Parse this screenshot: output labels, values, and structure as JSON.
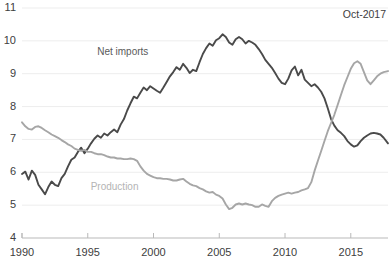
{
  "chart_data": {
    "type": "line",
    "title": "",
    "subtitle": "",
    "annotation": "Oct-2017",
    "xlabel": "",
    "ylabel": "",
    "xlim": [
      1990,
      2017.83
    ],
    "ylim": [
      4,
      11
    ],
    "xticks": [
      1990,
      1995,
      2000,
      2005,
      2010,
      2015
    ],
    "xticklabels": [
      "1990",
      "1995",
      "2000",
      "2005",
      "2010",
      "2015"
    ],
    "yticks": [
      4,
      5,
      6,
      7,
      8,
      9,
      10,
      11
    ],
    "yticklabels": [
      "4",
      "5",
      "6",
      "7",
      "8",
      "9",
      "10",
      "11"
    ],
    "grid": "horizontal",
    "legend": "inline-labels",
    "series": [
      {
        "name": "Net imports",
        "color": "#4a4a4a",
        "label_position": {
          "x": 1998.0,
          "y": 9.65
        },
        "points": [
          [
            1990.0,
            5.95
          ],
          [
            1990.25,
            6.02
          ],
          [
            1990.5,
            5.78
          ],
          [
            1990.75,
            6.05
          ],
          [
            1991.0,
            5.92
          ],
          [
            1991.25,
            5.62
          ],
          [
            1991.5,
            5.48
          ],
          [
            1991.75,
            5.33
          ],
          [
            1992.0,
            5.55
          ],
          [
            1992.25,
            5.72
          ],
          [
            1992.5,
            5.62
          ],
          [
            1992.75,
            5.58
          ],
          [
            1993.0,
            5.82
          ],
          [
            1993.25,
            5.95
          ],
          [
            1993.5,
            6.18
          ],
          [
            1993.75,
            6.38
          ],
          [
            1994.0,
            6.45
          ],
          [
            1994.25,
            6.62
          ],
          [
            1994.5,
            6.75
          ],
          [
            1994.75,
            6.58
          ],
          [
            1995.0,
            6.72
          ],
          [
            1995.25,
            6.88
          ],
          [
            1995.5,
            7.02
          ],
          [
            1995.75,
            7.12
          ],
          [
            1996.0,
            7.05
          ],
          [
            1996.25,
            7.18
          ],
          [
            1996.5,
            7.12
          ],
          [
            1996.75,
            7.22
          ],
          [
            1997.0,
            7.3
          ],
          [
            1997.25,
            7.22
          ],
          [
            1997.5,
            7.45
          ],
          [
            1997.75,
            7.62
          ],
          [
            1998.0,
            7.88
          ],
          [
            1998.25,
            8.1
          ],
          [
            1998.5,
            8.3
          ],
          [
            1998.75,
            8.25
          ],
          [
            1999.0,
            8.42
          ],
          [
            1999.25,
            8.58
          ],
          [
            1999.5,
            8.5
          ],
          [
            1999.75,
            8.62
          ],
          [
            2000.0,
            8.55
          ],
          [
            2000.25,
            8.48
          ],
          [
            2000.5,
            8.42
          ],
          [
            2000.75,
            8.58
          ],
          [
            2001.0,
            8.75
          ],
          [
            2001.25,
            8.92
          ],
          [
            2001.5,
            9.05
          ],
          [
            2001.75,
            9.2
          ],
          [
            2002.0,
            9.12
          ],
          [
            2002.25,
            9.3
          ],
          [
            2002.5,
            9.18
          ],
          [
            2002.75,
            9.02
          ],
          [
            2003.0,
            9.12
          ],
          [
            2003.25,
            9.08
          ],
          [
            2003.5,
            9.35
          ],
          [
            2003.75,
            9.6
          ],
          [
            2004.0,
            9.78
          ],
          [
            2004.25,
            9.92
          ],
          [
            2004.5,
            9.85
          ],
          [
            2004.75,
            10.02
          ],
          [
            2005.0,
            10.08
          ],
          [
            2005.25,
            10.2
          ],
          [
            2005.5,
            10.12
          ],
          [
            2005.75,
            9.95
          ],
          [
            2006.0,
            9.88
          ],
          [
            2006.25,
            10.05
          ],
          [
            2006.5,
            10.12
          ],
          [
            2006.75,
            10.05
          ],
          [
            2007.0,
            9.92
          ],
          [
            2007.25,
            10.0
          ],
          [
            2007.5,
            9.95
          ],
          [
            2007.75,
            9.88
          ],
          [
            2008.0,
            9.75
          ],
          [
            2008.25,
            9.6
          ],
          [
            2008.5,
            9.42
          ],
          [
            2008.75,
            9.3
          ],
          [
            2009.0,
            9.18
          ],
          [
            2009.25,
            9.02
          ],
          [
            2009.5,
            8.85
          ],
          [
            2009.75,
            8.72
          ],
          [
            2010.0,
            8.68
          ],
          [
            2010.25,
            8.85
          ],
          [
            2010.5,
            9.1
          ],
          [
            2010.75,
            9.22
          ],
          [
            2011.0,
            8.95
          ],
          [
            2011.25,
            9.12
          ],
          [
            2011.5,
            8.82
          ],
          [
            2011.75,
            8.72
          ],
          [
            2012.0,
            8.62
          ],
          [
            2012.25,
            8.68
          ],
          [
            2012.5,
            8.58
          ],
          [
            2012.75,
            8.45
          ],
          [
            2013.0,
            8.25
          ],
          [
            2013.25,
            7.95
          ],
          [
            2013.5,
            7.62
          ],
          [
            2013.75,
            7.42
          ],
          [
            2014.0,
            7.28
          ],
          [
            2014.25,
            7.2
          ],
          [
            2014.5,
            7.1
          ],
          [
            2014.75,
            6.95
          ],
          [
            2015.0,
            6.85
          ],
          [
            2015.25,
            6.78
          ],
          [
            2015.5,
            6.82
          ],
          [
            2015.75,
            6.95
          ],
          [
            2016.0,
            7.05
          ],
          [
            2016.25,
            7.12
          ],
          [
            2016.5,
            7.18
          ],
          [
            2016.75,
            7.2
          ],
          [
            2017.0,
            7.18
          ],
          [
            2017.25,
            7.15
          ],
          [
            2017.5,
            7.05
          ],
          [
            2017.83,
            6.88
          ]
        ]
      },
      {
        "name": "Production",
        "color": "#a6a6a6",
        "label_position": {
          "x": 1997.2,
          "y": 5.55
        },
        "points": [
          [
            1990.0,
            7.52
          ],
          [
            1990.25,
            7.4
          ],
          [
            1990.5,
            7.32
          ],
          [
            1990.75,
            7.3
          ],
          [
            1991.0,
            7.38
          ],
          [
            1991.25,
            7.4
          ],
          [
            1991.5,
            7.35
          ],
          [
            1991.75,
            7.28
          ],
          [
            1992.0,
            7.22
          ],
          [
            1992.25,
            7.15
          ],
          [
            1992.5,
            7.1
          ],
          [
            1992.75,
            7.05
          ],
          [
            1993.0,
            6.98
          ],
          [
            1993.25,
            6.92
          ],
          [
            1993.5,
            6.85
          ],
          [
            1993.75,
            6.8
          ],
          [
            1994.0,
            6.72
          ],
          [
            1994.25,
            6.68
          ],
          [
            1994.5,
            6.65
          ],
          [
            1994.75,
            6.68
          ],
          [
            1995.0,
            6.62
          ],
          [
            1995.25,
            6.62
          ],
          [
            1995.5,
            6.58
          ],
          [
            1995.75,
            6.55
          ],
          [
            1996.0,
            6.55
          ],
          [
            1996.25,
            6.52
          ],
          [
            1996.5,
            6.48
          ],
          [
            1996.75,
            6.45
          ],
          [
            1997.0,
            6.45
          ],
          [
            1997.25,
            6.42
          ],
          [
            1997.5,
            6.42
          ],
          [
            1997.75,
            6.4
          ],
          [
            1998.0,
            6.4
          ],
          [
            1998.25,
            6.42
          ],
          [
            1998.5,
            6.4
          ],
          [
            1998.75,
            6.35
          ],
          [
            1999.0,
            6.18
          ],
          [
            1999.25,
            6.05
          ],
          [
            1999.5,
            5.95
          ],
          [
            1999.75,
            5.9
          ],
          [
            2000.0,
            5.85
          ],
          [
            2000.25,
            5.82
          ],
          [
            2000.5,
            5.82
          ],
          [
            2000.75,
            5.8
          ],
          [
            2001.0,
            5.8
          ],
          [
            2001.25,
            5.78
          ],
          [
            2001.5,
            5.75
          ],
          [
            2001.75,
            5.75
          ],
          [
            2002.0,
            5.78
          ],
          [
            2002.25,
            5.8
          ],
          [
            2002.5,
            5.72
          ],
          [
            2002.75,
            5.65
          ],
          [
            2003.0,
            5.6
          ],
          [
            2003.25,
            5.58
          ],
          [
            2003.5,
            5.52
          ],
          [
            2003.75,
            5.48
          ],
          [
            2004.0,
            5.42
          ],
          [
            2004.25,
            5.38
          ],
          [
            2004.5,
            5.4
          ],
          [
            2004.75,
            5.32
          ],
          [
            2005.0,
            5.28
          ],
          [
            2005.25,
            5.2
          ],
          [
            2005.5,
            5.02
          ],
          [
            2005.75,
            4.88
          ],
          [
            2006.0,
            4.92
          ],
          [
            2006.25,
            5.02
          ],
          [
            2006.5,
            5.05
          ],
          [
            2006.75,
            5.02
          ],
          [
            2007.0,
            5.05
          ],
          [
            2007.25,
            5.02
          ],
          [
            2007.5,
            5.0
          ],
          [
            2007.75,
            4.95
          ],
          [
            2008.0,
            4.95
          ],
          [
            2008.25,
            5.02
          ],
          [
            2008.5,
            4.98
          ],
          [
            2008.75,
            4.95
          ],
          [
            2009.0,
            5.12
          ],
          [
            2009.25,
            5.22
          ],
          [
            2009.5,
            5.28
          ],
          [
            2009.75,
            5.32
          ],
          [
            2010.0,
            5.35
          ],
          [
            2010.25,
            5.38
          ],
          [
            2010.5,
            5.35
          ],
          [
            2010.75,
            5.38
          ],
          [
            2011.0,
            5.4
          ],
          [
            2011.25,
            5.45
          ],
          [
            2011.5,
            5.48
          ],
          [
            2011.75,
            5.52
          ],
          [
            2012.0,
            5.7
          ],
          [
            2012.25,
            6.05
          ],
          [
            2012.5,
            6.35
          ],
          [
            2012.75,
            6.65
          ],
          [
            2013.0,
            6.95
          ],
          [
            2013.25,
            7.25
          ],
          [
            2013.5,
            7.5
          ],
          [
            2013.75,
            7.75
          ],
          [
            2014.0,
            8.05
          ],
          [
            2014.25,
            8.35
          ],
          [
            2014.5,
            8.65
          ],
          [
            2014.75,
            8.9
          ],
          [
            2015.0,
            9.15
          ],
          [
            2015.25,
            9.32
          ],
          [
            2015.5,
            9.38
          ],
          [
            2015.75,
            9.3
          ],
          [
            2016.0,
            9.05
          ],
          [
            2016.25,
            8.8
          ],
          [
            2016.5,
            8.68
          ],
          [
            2016.75,
            8.8
          ],
          [
            2017.0,
            8.92
          ],
          [
            2017.25,
            9.0
          ],
          [
            2017.5,
            9.05
          ],
          [
            2017.83,
            9.08
          ]
        ]
      }
    ]
  },
  "axis": {
    "x_axis_color": "#b9b9b9",
    "grid_color": "#ededed"
  }
}
